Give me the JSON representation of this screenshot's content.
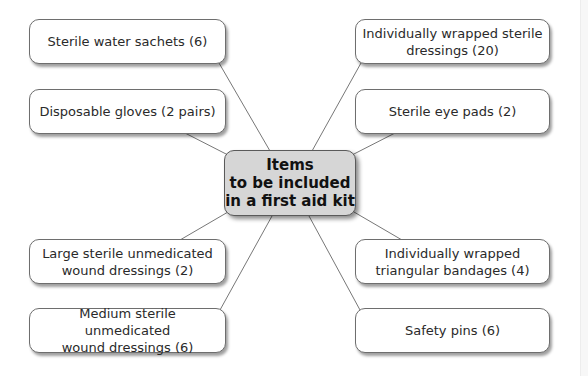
{
  "diagram": {
    "title_lines": [
      "Items",
      "to be included",
      "in a first aid kit"
    ],
    "colors": {
      "center_fill": "#d6d6d6",
      "node_fill": "#ffffff",
      "border": "#6e6e6e",
      "line": "#777777",
      "text": "#2a2a2a"
    },
    "nodes": [
      {
        "id": "sterile-water-sachets",
        "lines": [
          "Sterile water sachets (6)"
        ]
      },
      {
        "id": "disposable-gloves",
        "lines": [
          "Disposable gloves (2 pairs)"
        ]
      },
      {
        "id": "large-wound-dressings",
        "lines": [
          "Large sterile unmedicated",
          "wound dressings (2)"
        ]
      },
      {
        "id": "medium-wound-dressings",
        "lines": [
          "Medium sterile unmedicated",
          "wound dressings (6)"
        ]
      },
      {
        "id": "wrapped-sterile-dressings",
        "lines": [
          "Individually wrapped sterile",
          "dressings (20)"
        ]
      },
      {
        "id": "sterile-eye-pads",
        "lines": [
          "Sterile eye pads (2)"
        ]
      },
      {
        "id": "triangular-bandages",
        "lines": [
          "Individually wrapped",
          "triangular bandages (4)"
        ]
      },
      {
        "id": "safety-pins",
        "lines": [
          "Safety pins (6)"
        ]
      }
    ]
  }
}
